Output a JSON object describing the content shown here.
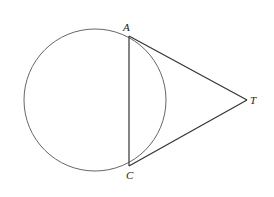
{
  "diagram": {
    "type": "geometry",
    "circle": {
      "cx": 95,
      "cy": 100,
      "r": 71
    },
    "points": [
      {
        "id": "A",
        "label": "A",
        "x": 129,
        "y": 36
      },
      {
        "id": "C",
        "label": "C",
        "x": 129,
        "y": 166
      },
      {
        "id": "T",
        "label": "T",
        "x": 247,
        "y": 100
      }
    ],
    "segments": [
      {
        "from": "A",
        "to": "C"
      },
      {
        "from": "A",
        "to": "T"
      },
      {
        "from": "C",
        "to": "T"
      }
    ],
    "colors": {
      "stroke": "#555555",
      "segment": "#333333"
    }
  }
}
